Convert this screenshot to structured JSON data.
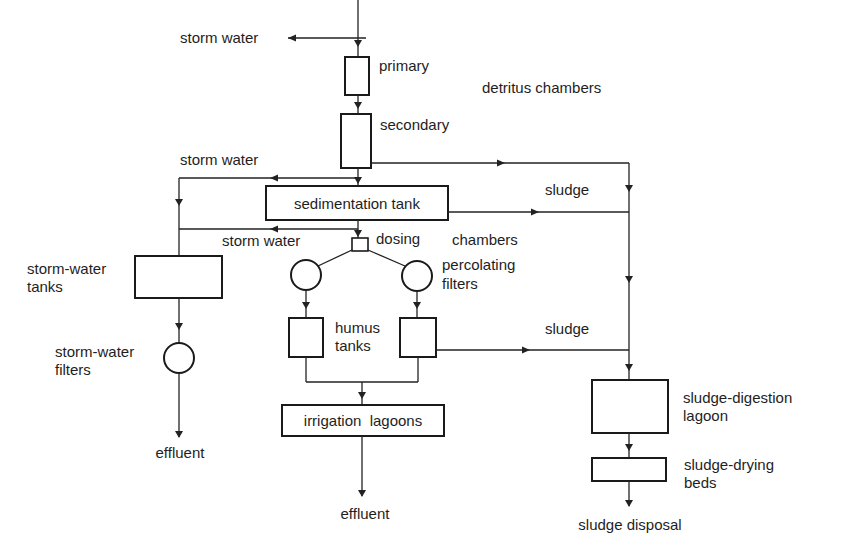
{
  "diagram": {
    "type": "process-flow",
    "colors": {
      "line": "#222222",
      "background": "#ffffff",
      "text": "#1e1e1e"
    },
    "labels": {
      "storm_water_top": "storm water",
      "primary": "primary",
      "detritus_chambers": "detritus chambers",
      "secondary": "secondary",
      "storm_water_mid": "storm water",
      "sludge_top": "sludge",
      "sedimentation_tank": "sedimentation tank",
      "storm_water_low": "storm water",
      "dosing": "dosing",
      "chambers": "chambers",
      "storm_water_tanks_1": "storm-water",
      "storm_water_tanks_2": "tanks",
      "percolating_filters_1": "percolating",
      "percolating_filters_2": "filters",
      "storm_water_filters_1": "storm-water",
      "storm_water_filters_2": "filters",
      "humus_tanks_1": "humus",
      "humus_tanks_2": "tanks",
      "sludge_humus": "sludge",
      "irrigation_lagoons": "irrigation  lagoons",
      "effluent_left": "effluent",
      "effluent_center": "effluent",
      "sludge_digestion_1": "sludge-digestion",
      "sludge_digestion_2": "lagoon",
      "sludge_drying_1": "sludge-drying",
      "sludge_drying_2": "beds",
      "sludge_disposal": "sludge disposal"
    },
    "nodes": [
      {
        "id": "primary",
        "label": "primary detritus chamber",
        "shape": "rect"
      },
      {
        "id": "secondary",
        "label": "secondary detritus chamber",
        "shape": "rect"
      },
      {
        "id": "sedimentation",
        "label": "sedimentation tank",
        "shape": "rect"
      },
      {
        "id": "dosing",
        "label": "dosing chambers",
        "shape": "rect-small"
      },
      {
        "id": "perc_left",
        "label": "percolating filter",
        "shape": "circle"
      },
      {
        "id": "perc_right",
        "label": "percolating filter",
        "shape": "circle"
      },
      {
        "id": "humus_left",
        "label": "humus tank",
        "shape": "rect"
      },
      {
        "id": "humus_right",
        "label": "humus tank",
        "shape": "rect"
      },
      {
        "id": "irrigation",
        "label": "irrigation lagoons",
        "shape": "rect"
      },
      {
        "id": "sw_tanks",
        "label": "storm-water tanks",
        "shape": "rect"
      },
      {
        "id": "sw_filters",
        "label": "storm-water filters",
        "shape": "circle"
      },
      {
        "id": "digestion",
        "label": "sludge-digestion lagoon",
        "shape": "rect"
      },
      {
        "id": "drying",
        "label": "sludge-drying beds",
        "shape": "rect"
      }
    ],
    "edges": [
      {
        "from": "inflow",
        "to": "storm water (overflow)"
      },
      {
        "from": "inflow",
        "to": "primary"
      },
      {
        "from": "primary",
        "to": "secondary"
      },
      {
        "from": "secondary",
        "to": "sedimentation"
      },
      {
        "from": "secondary",
        "to": "sludge line"
      },
      {
        "from": "secondary",
        "to": "storm-water tanks",
        "label": "storm water"
      },
      {
        "from": "sedimentation",
        "to": "sludge line",
        "label": "sludge"
      },
      {
        "from": "sedimentation",
        "to": "storm-water tanks",
        "label": "storm water"
      },
      {
        "from": "sedimentation",
        "to": "dosing"
      },
      {
        "from": "dosing",
        "to": "perc_left"
      },
      {
        "from": "dosing",
        "to": "perc_right"
      },
      {
        "from": "perc_left",
        "to": "humus_left"
      },
      {
        "from": "perc_right",
        "to": "humus_right"
      },
      {
        "from": "humus_left",
        "to": "irrigation"
      },
      {
        "from": "humus_right",
        "to": "irrigation"
      },
      {
        "from": "humus_right",
        "to": "sludge line",
        "label": "sludge"
      },
      {
        "from": "irrigation",
        "to": "effluent"
      },
      {
        "from": "sw_tanks",
        "to": "sw_filters"
      },
      {
        "from": "sw_filters",
        "to": "effluent"
      },
      {
        "from": "sludge line",
        "to": "digestion"
      },
      {
        "from": "digestion",
        "to": "drying"
      },
      {
        "from": "drying",
        "to": "sludge disposal"
      }
    ]
  }
}
